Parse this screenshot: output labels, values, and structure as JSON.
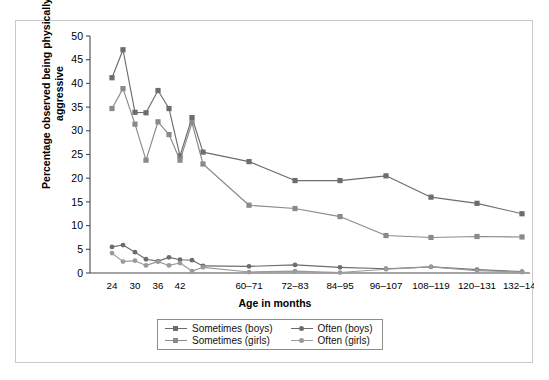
{
  "chart_data": {
    "type": "line",
    "title": "",
    "xlabel": "Age in months",
    "ylabel": "Percentage observed being physically aggressive",
    "ylim": [
      0,
      50
    ],
    "yticks": [
      0,
      5,
      10,
      15,
      20,
      25,
      30,
      35,
      40,
      45,
      50
    ],
    "grid": false,
    "legend_position": "bottom-center",
    "categories": [
      "24",
      "30",
      "36",
      "42",
      "60–71",
      "72–83",
      "84–95",
      "96–107",
      "108–119",
      "120–131",
      "132–143"
    ],
    "tick_labels": [
      "24",
      "30",
      "36",
      "42",
      "60–71",
      "72–83",
      "84–95",
      "96–107",
      "108–119",
      "120–131",
      "132–143"
    ],
    "x_index": [
      0,
      1,
      2,
      3,
      4,
      5,
      6,
      7,
      8,
      9,
      10,
      11,
      12,
      13,
      14,
      15,
      16,
      17,
      18,
      19
    ],
    "series": [
      {
        "name": "Sometimes (boys)",
        "color": "#6d6d6d",
        "marker": "square",
        "x": [
          0,
          1,
          2,
          3,
          4,
          5,
          6,
          7,
          8,
          9,
          10,
          11,
          12,
          13,
          14,
          15,
          16
        ],
        "values": [
          41.2,
          47.1,
          33.9,
          33.8,
          38.5,
          34.7,
          24.7,
          32.8,
          25.5,
          23.5,
          19.5,
          19.5,
          20.5,
          16.0,
          14.7,
          12.5,
          null
        ]
      },
      {
        "name": "Sometimes (girls)",
        "color": "#8a8a8a",
        "marker": "square",
        "x": [
          0,
          1,
          2,
          3,
          4,
          5,
          6,
          7,
          8,
          9,
          10,
          11,
          12,
          13,
          14,
          15,
          16
        ],
        "values": [
          34.7,
          38.9,
          31.4,
          23.8,
          31.9,
          29.2,
          23.8,
          31.7,
          23.0,
          14.3,
          13.6,
          11.9,
          7.9,
          7.5,
          7.7,
          7.6,
          null
        ]
      },
      {
        "name": "Often (boys)",
        "color": "#6d6d6d",
        "marker": "circle",
        "x": [
          0,
          1,
          2,
          3,
          4,
          5,
          6,
          7,
          8,
          9,
          10,
          11,
          12,
          13,
          14,
          15,
          16
        ],
        "values": [
          5.5,
          5.9,
          4.4,
          2.9,
          2.5,
          3.3,
          2.8,
          2.7,
          1.5,
          1.4,
          1.7,
          1.2,
          0.9,
          1.3,
          0.7,
          0.3,
          null
        ]
      },
      {
        "name": "Often (girls)",
        "color": "#9a9a9a",
        "marker": "circle",
        "x": [
          0,
          1,
          2,
          3,
          4,
          5,
          6,
          7,
          8,
          9,
          10,
          11,
          12,
          13,
          14,
          15,
          16
        ],
        "values": [
          4.2,
          2.4,
          2.6,
          1.6,
          2.4,
          1.6,
          2.1,
          0.4,
          1.2,
          0.2,
          0.4,
          0.1,
          0.8,
          1.3,
          0.5,
          0.2,
          null
        ]
      }
    ],
    "sometimes_boys_points": [
      {
        "px": 96,
        "v": 41.2
      },
      {
        "px": 107,
        "v": 47.1
      },
      {
        "px": 119,
        "v": 33.9
      },
      {
        "px": 130,
        "v": 33.8
      },
      {
        "px": 142,
        "v": 38.5
      },
      {
        "px": 153,
        "v": 34.7
      },
      {
        "px": 164,
        "v": 24.7
      },
      {
        "px": 176,
        "v": 32.8
      },
      {
        "px": 187,
        "v": 25.5
      },
      {
        "px": 233,
        "v": 23.5
      },
      {
        "px": 279,
        "v": 19.5
      },
      {
        "px": 324,
        "v": 19.5
      },
      {
        "px": 370,
        "v": 20.5
      },
      {
        "px": 415,
        "v": 16.0
      },
      {
        "px": 461,
        "v": 14.7
      },
      {
        "px": 506,
        "v": 12.5
      }
    ],
    "sometimes_girls_points": [
      {
        "px": 96,
        "v": 34.7
      },
      {
        "px": 107,
        "v": 38.9
      },
      {
        "px": 119,
        "v": 31.4
      },
      {
        "px": 130,
        "v": 23.8
      },
      {
        "px": 142,
        "v": 31.9
      },
      {
        "px": 153,
        "v": 29.2
      },
      {
        "px": 164,
        "v": 23.8
      },
      {
        "px": 176,
        "v": 31.7
      },
      {
        "px": 187,
        "v": 23.0
      },
      {
        "px": 233,
        "v": 14.3
      },
      {
        "px": 279,
        "v": 13.6
      },
      {
        "px": 324,
        "v": 11.9
      },
      {
        "px": 370,
        "v": 7.9
      },
      {
        "px": 415,
        "v": 7.5
      },
      {
        "px": 461,
        "v": 7.7
      },
      {
        "px": 506,
        "v": 7.6
      }
    ],
    "often_boys_points": [
      {
        "px": 96,
        "v": 5.5
      },
      {
        "px": 107,
        "v": 5.9
      },
      {
        "px": 119,
        "v": 4.4
      },
      {
        "px": 130,
        "v": 2.9
      },
      {
        "px": 142,
        "v": 2.5
      },
      {
        "px": 153,
        "v": 3.3
      },
      {
        "px": 164,
        "v": 2.8
      },
      {
        "px": 176,
        "v": 2.7
      },
      {
        "px": 187,
        "v": 1.5
      },
      {
        "px": 233,
        "v": 1.4
      },
      {
        "px": 279,
        "v": 1.7
      },
      {
        "px": 324,
        "v": 1.2
      },
      {
        "px": 370,
        "v": 0.9
      },
      {
        "px": 415,
        "v": 1.3
      },
      {
        "px": 461,
        "v": 0.7
      },
      {
        "px": 506,
        "v": 0.3
      }
    ],
    "often_girls_points": [
      {
        "px": 96,
        "v": 4.2
      },
      {
        "px": 107,
        "v": 2.4
      },
      {
        "px": 119,
        "v": 2.6
      },
      {
        "px": 130,
        "v": 1.6
      },
      {
        "px": 142,
        "v": 2.4
      },
      {
        "px": 153,
        "v": 1.6
      },
      {
        "px": 164,
        "v": 2.1
      },
      {
        "px": 176,
        "v": 0.4
      },
      {
        "px": 187,
        "v": 1.2
      },
      {
        "px": 233,
        "v": 0.2
      },
      {
        "px": 279,
        "v": 0.4
      },
      {
        "px": 324,
        "v": 0.1
      },
      {
        "px": 370,
        "v": 0.8
      },
      {
        "px": 415,
        "v": 1.3
      },
      {
        "px": 461,
        "v": 0.5
      },
      {
        "px": 506,
        "v": 0.2
      }
    ],
    "tick_px": [
      96,
      119,
      142,
      164,
      233,
      279,
      324,
      370,
      415,
      461,
      506
    ]
  },
  "axes": {
    "ylabel": "Percentage observed being physically aggressive",
    "ylabel_line1": "Percentage observed being physically",
    "ylabel_line2": "aggressive",
    "xlabel": "Age in months"
  },
  "legend": {
    "items": [
      {
        "label": "Sometimes (boys)",
        "marker": "square",
        "color": "#6d6d6d"
      },
      {
        "label": "Often (boys)",
        "marker": "circle",
        "color": "#6d6d6d"
      },
      {
        "label": "Sometimes (girls)",
        "marker": "square",
        "color": "#8a8a8a"
      },
      {
        "label": "Often (girls)",
        "marker": "circle",
        "color": "#9a9a9a"
      }
    ]
  },
  "colors": {
    "boys": "#6d6d6d",
    "girls": "#8a8a8a",
    "axis": "#4a4a4a",
    "frame": "#c9c9c9",
    "background": "#ffffff"
  }
}
